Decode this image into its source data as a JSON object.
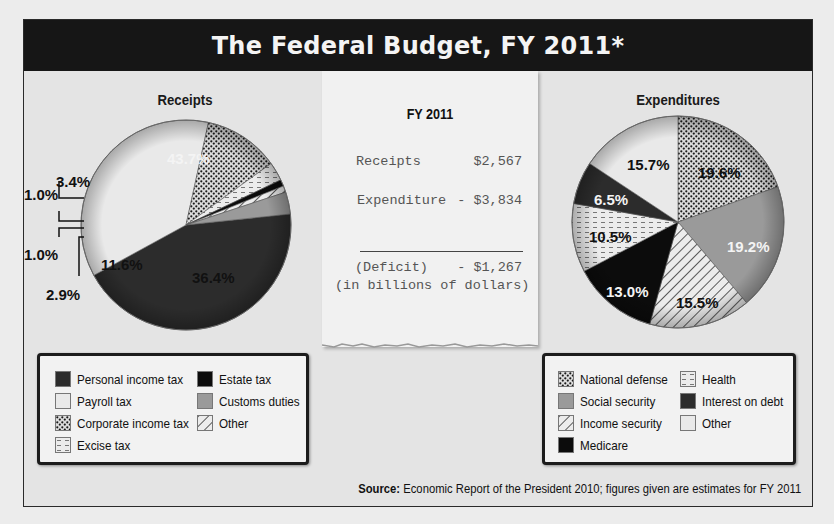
{
  "header": {
    "title": "The Federal Budget, FY 2011*"
  },
  "receipt_slip": {
    "heading": "FY 2011",
    "rows": [
      {
        "label": "Receipts",
        "value": "$2,567"
      },
      {
        "label": "Expenditure",
        "value": "- $3,834"
      },
      {
        "label": "(Deficit)",
        "value": "- $1,267"
      }
    ],
    "units_note": "(in billions of dollars)"
  },
  "source": {
    "label": "Source:",
    "text": "Economic Report of the President 2010; figures given are estimates for FY 2011"
  },
  "colors": {
    "title_bar": "#161616",
    "dark": "#2c2c2c",
    "black": "#0c0c0c",
    "light": "#e9e9e9",
    "gray": "#9a9a9a",
    "pattern_dots": "#1a1a1a"
  },
  "chart_data": [
    {
      "type": "pie",
      "title": "Receipts",
      "categories": [
        "Personal income tax",
        "Payroll tax",
        "Corporate income tax",
        "Excise tax",
        "Estate tax",
        "Other",
        "Customs duties"
      ],
      "values": [
        43.7,
        36.4,
        11.6,
        2.9,
        1.0,
        1.0,
        3.4
      ],
      "labels": [
        "43.7%",
        "36.4%",
        "11.6%",
        "2.9%",
        "1.0%",
        "1.0%",
        "3.4%"
      ],
      "legend": {
        "columns": [
          [
            "Personal income tax",
            "Payroll tax",
            "Corporate income tax",
            "Excise tax"
          ],
          [
            "Estate tax",
            "Customs duties",
            "Other"
          ]
        ],
        "position": "bottom"
      },
      "units": "percent"
    },
    {
      "type": "pie",
      "title": "Expenditures",
      "categories": [
        "National defense",
        "Social security",
        "Income security",
        "Medicare",
        "Health",
        "Interest on debt",
        "Other"
      ],
      "values": [
        19.6,
        19.2,
        15.5,
        13.0,
        10.5,
        6.5,
        15.7
      ],
      "labels": [
        "19.6%",
        "19.2%",
        "15.5%",
        "13.0%",
        "10.5%",
        "6.5%",
        "15.7%"
      ],
      "legend": {
        "columns": [
          [
            "National defense",
            "Social security",
            "Income security",
            "Medicare"
          ],
          [
            "Health",
            "Interest on debt",
            "Other"
          ]
        ],
        "position": "bottom"
      },
      "units": "percent"
    }
  ]
}
